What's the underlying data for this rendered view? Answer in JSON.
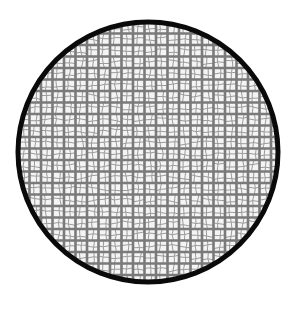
{
  "figure": {
    "colors": {
      "background": "#ffffff",
      "rim": "#0a0a0a",
      "mesh_wire": "#7a7a7a",
      "mesh_fine": "#9a9a9a",
      "cell_fill": "#f4f4f4"
    },
    "circle": {
      "cx": 148,
      "cy": 152,
      "r": 130,
      "rim_width": 5
    },
    "grid": {
      "spacing": 11.5,
      "wire_width": 2.6
    }
  }
}
